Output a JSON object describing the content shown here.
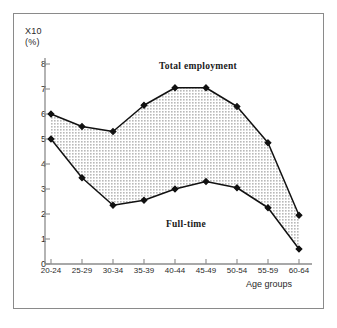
{
  "figure": {
    "frame_color": "#8a8a8a",
    "background": "#ffffff"
  },
  "axis": {
    "y_unit_label": "X10",
    "y_unit_sublabel": "(%)",
    "x_axis_title": "Age groups",
    "y_ticks": [
      "0",
      "1",
      "2",
      "3",
      "4",
      "5",
      "6",
      "7",
      "8"
    ],
    "x_ticks": [
      "20-24",
      "25-29",
      "30-34",
      "35-39",
      "40-44",
      "45-49",
      "50-54",
      "55-59",
      "60-64"
    ]
  },
  "labels": {
    "total": "Total employment",
    "part": "Part-time",
    "full": "Full-time"
  },
  "chart_data": {
    "type": "area",
    "title": "",
    "subtitle": "",
    "xlabel": "Age groups",
    "ylabel": "X10 (%)",
    "categories": [
      "20-24",
      "25-29",
      "30-34",
      "35-39",
      "40-44",
      "45-49",
      "50-54",
      "55-59",
      "60-64"
    ],
    "series": [
      {
        "name": "Total employment",
        "values": [
          6.0,
          5.5,
          5.3,
          6.35,
          7.05,
          7.05,
          6.3,
          4.85,
          1.95
        ]
      },
      {
        "name": "Full-time",
        "values": [
          5.0,
          3.45,
          2.35,
          2.55,
          3.0,
          3.3,
          3.05,
          2.25,
          0.6
        ]
      },
      {
        "name": "Part-time",
        "values": [
          1.0,
          2.05,
          2.95,
          3.8,
          4.05,
          3.75,
          3.25,
          2.6,
          1.35
        ]
      }
    ],
    "ylim": [
      0,
      8
    ],
    "yticks": [
      0,
      1,
      2,
      3,
      4,
      5,
      6,
      7,
      8
    ],
    "grid": false,
    "legend": "inline-annotations",
    "fill_between": {
      "upper": "Total employment",
      "lower": "Full-time",
      "label": "Part-time",
      "color": "#d8d8d8"
    },
    "marker": "filled-diamond",
    "line_color": "#111111"
  }
}
